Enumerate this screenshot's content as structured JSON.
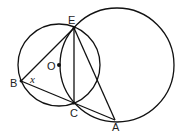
{
  "diagram": {
    "points": {
      "E": {
        "label": "E",
        "x": 74,
        "y": 28
      },
      "B": {
        "label": "B",
        "x": 21,
        "y": 81
      },
      "C": {
        "label": "C",
        "x": 74,
        "y": 103
      },
      "A": {
        "label": "A",
        "x": 115,
        "y": 120
      },
      "O": {
        "label": "O",
        "x": 59,
        "y": 65
      }
    },
    "angle_label": "x",
    "circles": [
      {
        "name": "circle-O",
        "cx": 59,
        "cy": 65,
        "r": 41
      },
      {
        "name": "circle-large",
        "cx": 117,
        "cy": 65,
        "r": 57
      }
    ],
    "segments": [
      "BE",
      "BC",
      "BA",
      "EC",
      "EA"
    ]
  }
}
